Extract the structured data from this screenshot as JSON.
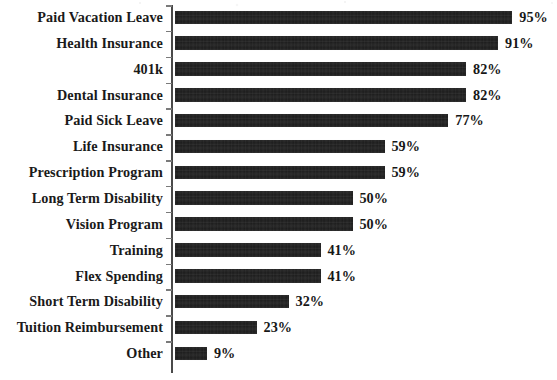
{
  "chart_data": {
    "type": "bar",
    "orientation": "horizontal",
    "title": "",
    "xlabel": "",
    "ylabel": "",
    "xlim": [
      0,
      100
    ],
    "grid": false,
    "legend": "none",
    "value_suffix": "%",
    "categories": [
      "Paid Vacation Leave",
      "Health Insurance",
      "401k",
      "Dental Insurance",
      "Paid Sick Leave",
      "Life Insurance",
      "Prescription Program",
      "Long Term Disability",
      "Vision Program",
      "Training",
      "Flex Spending",
      "Short Term Disability",
      "Tuition Reimbursement",
      "Other"
    ],
    "values": [
      95,
      91,
      82,
      82,
      77,
      59,
      59,
      50,
      50,
      41,
      41,
      32,
      23,
      9
    ],
    "data_labels": [
      "95%",
      "91%",
      "82%",
      "82%",
      "77%",
      "59%",
      "59%",
      "50%",
      "50%",
      "41%",
      "41%",
      "32%",
      "23%",
      "9%"
    ],
    "bar_color": "#1b1b1b",
    "axis_color": "#4a4a4a",
    "background_color": "#ffffff"
  }
}
